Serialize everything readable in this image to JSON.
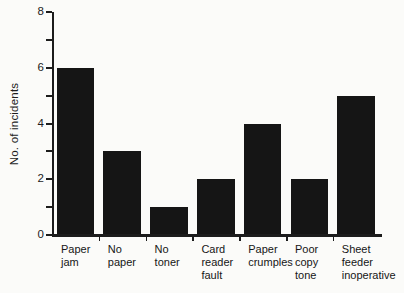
{
  "figure": {
    "background": "#fbfbf9"
  },
  "chart_data": {
    "type": "bar",
    "title": "",
    "xlabel": "",
    "ylabel": "No. of incidents",
    "categories": [
      "Paper jam",
      "No paper",
      "No toner",
      "Card reader fault",
      "Paper crumples",
      "Poor copy tone",
      "Sheet feeder inoperative"
    ],
    "category_label_lines": [
      [
        "Paper",
        "jam"
      ],
      [
        "No",
        "paper"
      ],
      [
        "No",
        "toner"
      ],
      [
        "Card",
        "reader",
        "fault"
      ],
      [
        "Paper",
        "crumples"
      ],
      [
        "Poor",
        "copy",
        "tone"
      ],
      [
        "Sheet",
        "feeder",
        "inoperative"
      ]
    ],
    "values": [
      6,
      3,
      1,
      2,
      4,
      2,
      5
    ],
    "ylim": [
      0,
      8
    ],
    "ytick_labels": [
      0,
      2,
      4,
      6,
      8
    ],
    "ytick_minor": [
      1,
      3,
      5,
      7
    ],
    "grid": false,
    "legend": "none",
    "bar_color": "#151515",
    "axis_color": "#1c1c1c"
  }
}
